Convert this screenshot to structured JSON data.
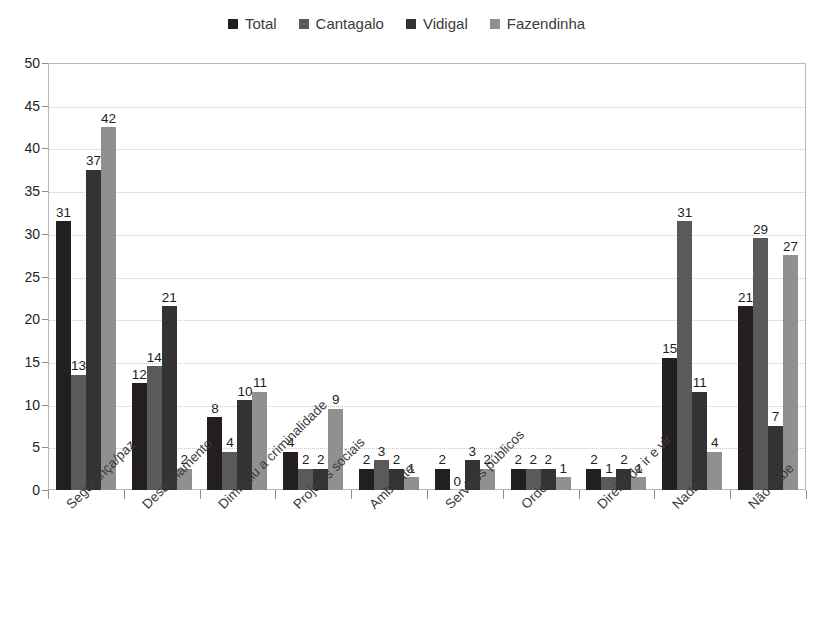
{
  "chart_data": {
    "type": "bar",
    "title": "",
    "subtitle": "",
    "xlabel": "",
    "ylabel": "",
    "ylim": [
      0,
      50
    ],
    "ytick_step": 5,
    "yticks": [
      0,
      5,
      10,
      15,
      20,
      25,
      30,
      35,
      40,
      45,
      50
    ],
    "grid": true,
    "legend_position": "top-center",
    "categories": [
      "Segurança/paz",
      "Desarmamento",
      "Diminuiu a criminalidade",
      "Projetos sociais",
      "Ambiente",
      "Serviços públicos",
      "Ordem",
      "Direito de ir e vir",
      "Nada",
      "Não sabe"
    ],
    "series": [
      {
        "name": "Total",
        "color": "#231f20",
        "values": [
          31,
          12,
          8,
          4,
          2,
          2,
          2,
          2,
          15,
          21
        ]
      },
      {
        "name": "Cantagalo",
        "color": "#5a5a5a",
        "values": [
          13,
          14,
          4,
          2,
          3,
          0,
          2,
          1,
          31,
          29
        ]
      },
      {
        "name": "Vidigal",
        "color": "#333333",
        "values": [
          37,
          21,
          10,
          2,
          2,
          3,
          2,
          2,
          11,
          7
        ]
      },
      {
        "name": "Fazendinha",
        "color": "#909090",
        "values": [
          42,
          2,
          11,
          9,
          1,
          2,
          1,
          1,
          4,
          27
        ]
      }
    ]
  }
}
